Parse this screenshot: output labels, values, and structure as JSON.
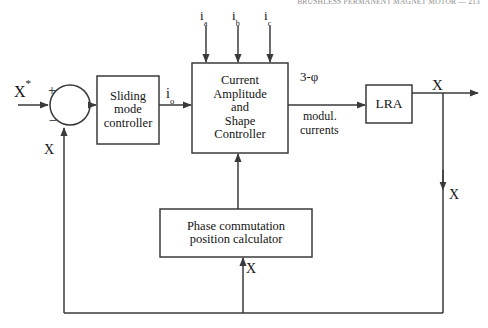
{
  "page": {
    "width": 488,
    "height": 328,
    "background": "#ffffff",
    "running_header": "BRUSHLESS PERMANENT MAGNET MOTOR  —  213"
  },
  "diagram": {
    "line_color": "#3a3a3a",
    "blocks": [
      {
        "id": "sliding-mode-controller",
        "lines": [
          "Sliding",
          "mode",
          "controller"
        ],
        "x": 97,
        "y": 76,
        "w": 62,
        "h": 68,
        "font_size": 12.5
      },
      {
        "id": "current-amplitude-shape-controller",
        "lines": [
          "Current",
          "Amplitude",
          "and",
          "Shape",
          "Controller"
        ],
        "x": 192,
        "y": 63,
        "w": 96,
        "h": 90,
        "font_size": 12.5
      },
      {
        "id": "lra",
        "lines": [
          "LRA"
        ],
        "x": 366,
        "y": 85,
        "w": 46,
        "h": 38,
        "font_size": 13.5
      },
      {
        "id": "phase-commutation-position-calculator",
        "lines": [
          "Phase commutation",
          "position calculator"
        ],
        "x": 160,
        "y": 209,
        "w": 152,
        "h": 48,
        "font_size": 12.5
      }
    ],
    "summing_junction": {
      "id": "summing-junction",
      "cx": 70,
      "cy": 105,
      "r": 20,
      "plus_sign": "+",
      "minus_sign": "−"
    },
    "labels": [
      {
        "id": "reference-input",
        "base": "X",
        "sup": "*",
        "x": 14,
        "y": 82,
        "font_size": 16
      },
      {
        "id": "plus-sign",
        "base": "+",
        "x": 48,
        "y": 84,
        "font_size": 14
      },
      {
        "id": "minus-sign",
        "base": "−",
        "x": 49,
        "y": 114,
        "font_size": 14
      },
      {
        "id": "feedback-x-inner",
        "base": "X",
        "x": 44,
        "y": 143,
        "font_size": 14
      },
      {
        "id": "current-io",
        "base": "i",
        "sub": "o",
        "x": 166,
        "y": 87,
        "font_size": 14
      },
      {
        "id": "current-ia",
        "base": "i",
        "sub": "a",
        "x": 200,
        "y": 9,
        "font_size": 13
      },
      {
        "id": "current-ib",
        "base": "i",
        "sub": "b",
        "x": 232,
        "y": 9,
        "font_size": 13
      },
      {
        "id": "current-ic",
        "base": "i",
        "sub": "c",
        "x": 264,
        "y": 9,
        "font_size": 13
      },
      {
        "id": "three-phase",
        "base": "3-φ",
        "x": 300,
        "y": 70,
        "font_size": 13
      },
      {
        "id": "modulated-currents-line1",
        "base": "modul.",
        "x": 303,
        "y": 110,
        "font_size": 12
      },
      {
        "id": "modulated-currents-line2",
        "base": "currents",
        "x": 300,
        "y": 124,
        "font_size": 12
      },
      {
        "id": "output-x",
        "base": "X",
        "x": 432,
        "y": 78,
        "font_size": 15
      },
      {
        "id": "output-x-branch",
        "base": "X",
        "x": 449,
        "y": 188,
        "font_size": 14
      },
      {
        "id": "position-feedback-x",
        "base": "X",
        "x": 246,
        "y": 262,
        "font_size": 14
      }
    ]
  }
}
